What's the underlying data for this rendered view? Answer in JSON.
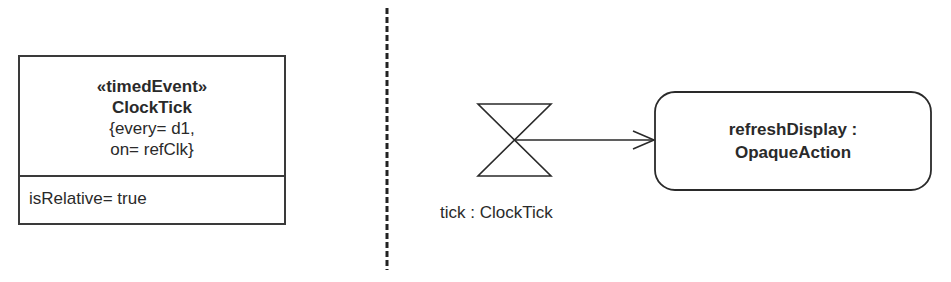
{
  "left_panel": {
    "class_box": {
      "stereotype": "«timedEvent»",
      "name": "ClockTick",
      "constraints": [
        "{every= d1,",
        "on= refClk}"
      ],
      "attributes": [
        "isRelative= true"
      ]
    }
  },
  "right_panel": {
    "time_event": {
      "icon": "hourglass-icon",
      "label": "tick : ClockTick"
    },
    "action": {
      "lines": [
        "refreshDisplay :",
        "OpaqueAction"
      ]
    }
  }
}
